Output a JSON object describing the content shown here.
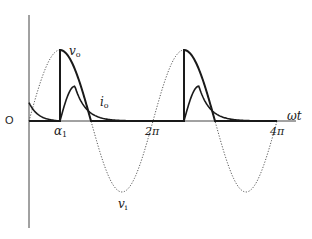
{
  "diagram": {
    "title": "",
    "axis": {
      "origin_label": "O",
      "x_label": "ωt",
      "ticks": [
        {
          "label_main": "α",
          "label_sub": "1",
          "theta_over_pi": 0.5
        },
        {
          "label_main": "2π",
          "label_sub": "",
          "theta_over_pi": 2.0
        },
        {
          "label_main": "4π",
          "label_sub": "",
          "theta_over_pi": 4.0
        }
      ]
    },
    "curves": {
      "v_i": {
        "label_main": "v",
        "label_sub": "i",
        "style": "dotted",
        "description": "input sinusoidal voltage"
      },
      "v_o": {
        "label_main": "v",
        "label_sub": "o",
        "style": "solid-thick",
        "description": "output voltage, conducts from α1 to π each period"
      },
      "i_o": {
        "label_main": "i",
        "label_sub": "o",
        "style": "solid",
        "description": "output current, rises at α1 then decays"
      }
    },
    "params": {
      "firing_angle_over_pi": 0.5,
      "periods": 2
    },
    "colors": {
      "background": "#ffffff",
      "ink": "#1a1a1a",
      "dotted": "#555555"
    }
  }
}
